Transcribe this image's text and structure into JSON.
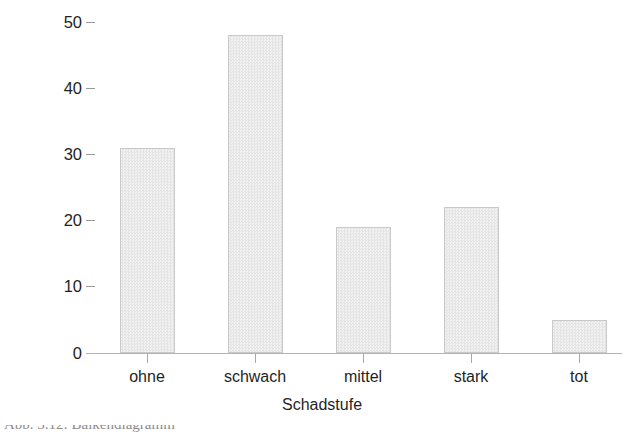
{
  "chart_data": {
    "type": "bar",
    "title": "",
    "xlabel": "Schadstufe",
    "ylabel": "absolute Häufigkeit",
    "categories": [
      "ohne",
      "schwach",
      "mittel",
      "stark",
      "tot"
    ],
    "values": [
      31,
      48,
      19,
      22,
      5
    ],
    "series": [
      {
        "name": "absolute Häufigkeit",
        "values": [
          31,
          48,
          19,
          22,
          5
        ]
      }
    ],
    "ylim": [
      0,
      50
    ],
    "yticks": [
      0,
      10,
      20,
      30,
      40,
      50
    ],
    "ytick_labels": [
      "0",
      "10",
      "20",
      "30",
      "40",
      "50"
    ],
    "grid": false,
    "legend": false,
    "legend_position": "none",
    "bar_fill_color": "#ececec",
    "bar_border_color": "#c9c9c9",
    "axis_color": "#b4b4b4",
    "text_color": "#1f1f1f"
  },
  "caption": {
    "text": "Abb. 3.12: Balkendiagramm"
  }
}
